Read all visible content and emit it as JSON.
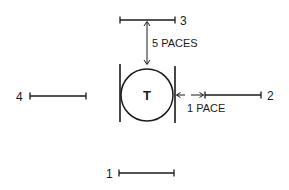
{
  "diagram": {
    "center": {
      "label": "T",
      "cx": 147,
      "cy": 95,
      "r": 26
    },
    "colors": {
      "ink": "#1a1a1a",
      "background": "#ffffff"
    },
    "positions": [
      {
        "id": "1",
        "label": "1"
      },
      {
        "id": "2",
        "label": "2"
      },
      {
        "id": "3",
        "label": "3"
      },
      {
        "id": "4",
        "label": "4"
      }
    ],
    "annotations": {
      "vertical_distance": "5 PACES",
      "horizontal_distance": "1 PACE"
    }
  }
}
